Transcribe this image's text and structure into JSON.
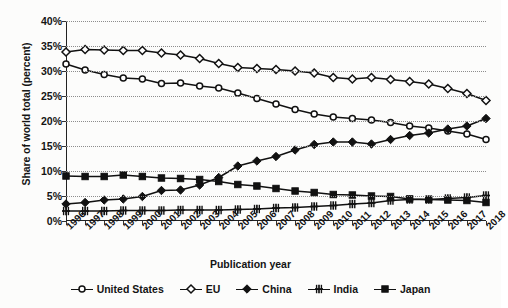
{
  "chart_data": {
    "type": "line",
    "title": "",
    "xlabel": "Publication year",
    "ylabel": "Share of world total (percent)",
    "grid": true,
    "legend_position": "bottom",
    "ylim": [
      0,
      40
    ],
    "ytick_labels": [
      "0%",
      "5%",
      "10%",
      "15%",
      "20%",
      "25%",
      "30%",
      "35%",
      "40%"
    ],
    "ytick_values": [
      0,
      5,
      10,
      15,
      20,
      25,
      30,
      35,
      40
    ],
    "categories": [
      "1996",
      "1997",
      "1998",
      "1999",
      "2000",
      "2001",
      "2002",
      "2003",
      "2004",
      "2005",
      "2006",
      "2007",
      "2008",
      "2009",
      "2010",
      "2011",
      "2012",
      "2013",
      "2014",
      "2015",
      "2016",
      "2017",
      "2018"
    ],
    "series": [
      {
        "name": "United States",
        "marker": "open-circle",
        "values": [
          31.4,
          30.2,
          29.3,
          28.6,
          28.4,
          27.5,
          27.6,
          27.0,
          26.6,
          25.6,
          24.5,
          23.4,
          22.3,
          21.4,
          20.8,
          20.5,
          20.2,
          19.7,
          19.0,
          18.6,
          18.0,
          17.4,
          16.3
        ]
      },
      {
        "name": "EU",
        "marker": "open-diamond",
        "values": [
          33.8,
          34.3,
          34.2,
          34.1,
          34.1,
          33.6,
          33.2,
          32.5,
          31.5,
          30.7,
          30.5,
          30.3,
          30.0,
          29.6,
          28.7,
          28.4,
          28.7,
          28.3,
          27.9,
          27.4,
          26.5,
          25.5,
          24.1
        ]
      },
      {
        "name": "China",
        "marker": "filled-diamond",
        "values": [
          3.4,
          3.7,
          4.2,
          4.4,
          4.9,
          6.1,
          6.2,
          7.2,
          8.7,
          11.0,
          12.0,
          12.9,
          14.2,
          15.3,
          15.8,
          15.8,
          15.4,
          16.3,
          17.1,
          17.6,
          18.4,
          19.0,
          20.5
        ]
      },
      {
        "name": "India",
        "marker": "plus",
        "values": [
          2.0,
          2.0,
          2.0,
          2.1,
          2.1,
          2.1,
          2.2,
          2.2,
          2.2,
          2.3,
          2.4,
          2.6,
          2.7,
          2.9,
          3.1,
          3.4,
          3.6,
          4.1,
          4.3,
          4.3,
          4.5,
          4.7,
          5.1
        ]
      },
      {
        "name": "Japan",
        "marker": "filled-square",
        "values": [
          9.0,
          8.9,
          8.9,
          9.2,
          8.9,
          8.6,
          8.5,
          8.3,
          7.9,
          7.3,
          7.0,
          6.5,
          6.0,
          5.7,
          5.3,
          5.2,
          5.0,
          4.9,
          4.4,
          4.3,
          4.2,
          4.1,
          3.7
        ]
      }
    ]
  },
  "legend": {
    "items": [
      {
        "label": "United States"
      },
      {
        "label": "EU"
      },
      {
        "label": "China"
      },
      {
        "label": "India"
      },
      {
        "label": "Japan"
      }
    ]
  },
  "colors": {
    "line": "#111111",
    "grid": "#8d8d8d",
    "axis": "#222222",
    "background": "#fcfcfb"
  }
}
